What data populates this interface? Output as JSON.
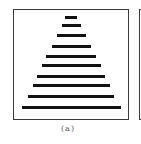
{
  "figure": {
    "caption": "(a)",
    "bar_count": 10,
    "bar_relative_widths": [
      0.1,
      0.16,
      0.25,
      0.34,
      0.43,
      0.51,
      0.59,
      0.66,
      0.74,
      0.85
    ],
    "colors": {
      "bar": "#111111",
      "frame": "#3a3a3a",
      "background": "#ffffff"
    }
  }
}
